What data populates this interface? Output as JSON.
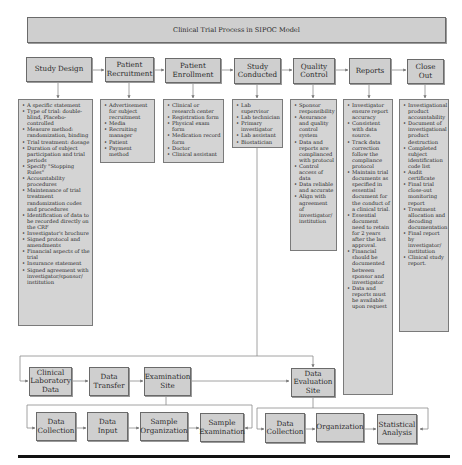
{
  "title": "Clinical Trial Process in SIPOC Model",
  "stages": [
    {
      "label": "Study Design",
      "items": [
        "A specific statement",
        "Type of trial: double-blind, Placebo-controlled",
        "Measure method: randomization, binding",
        "Trial treatment: dosage",
        "Duration of subject participation and trial periods",
        "Specify \"Stopping Rules\"",
        "Accountability procedures",
        "Maintenance of trial treatment randomization codes and procedures",
        "Identification of data to be recorded directly on the CRF",
        "Investigator's brochure",
        "Signed protocol and amendments",
        "Financial aspects of the trial",
        "Insurance statement",
        "Signed agreement with investigator/sponsor/ institution"
      ]
    },
    {
      "label": "Patient Recruitment",
      "items": [
        "Advertisement for subject recruitment",
        "Media",
        "Recruiting manager",
        "Patient",
        "Payment method"
      ]
    },
    {
      "label": "Patient Enrollment",
      "items": [
        "Clinical or research center",
        "Registration form",
        "Physical exam form",
        "Medication record form",
        "Doctor",
        "Clinical assistant"
      ]
    },
    {
      "label": "Study Conducted",
      "items": [
        "Lab supervisor",
        "Lab technician",
        "Primary investigator",
        "Lab assistant",
        "Biostatician"
      ]
    },
    {
      "label": "Quality Control",
      "items": [
        "Sponsor responsibility",
        "Assurance and quality control system",
        "Data and reports are complianced with protocol",
        "Control access of data",
        "Data reliable and accurate",
        "Align with agreement of investigator/ institution"
      ]
    },
    {
      "label": "Reports",
      "items": [
        "Investigator ensure report accuracy",
        "Consistent with data source.",
        "Track data correction follow the compliance protocol",
        "Maintain trial documents as specified in essential document for the conduct of a clinical trial.",
        "Essential document need to retain for 2 years after the last approval.",
        "Financial should be documented between sponsor and investigator",
        "Data and reports must be available upon request"
      ]
    },
    {
      "label": "Close Out",
      "items": [
        "Investigational product accountability",
        "Document of investigational product destruction",
        "Completed subject identification code list",
        "Audit certificate",
        "Final trial close-out monitoring report",
        "Treatment allocation and decoding documentation",
        "Final report by investigator/ institution",
        "Clinical study report."
      ]
    }
  ],
  "lower_row1": [
    "Clinical Laboratory Data",
    "Data Transfer",
    "Examination Site",
    "Data Evaluation Site"
  ],
  "lower_row2_left": [
    "Data Collection",
    "Data Input",
    "Sample Organization",
    "Sample Examination"
  ],
  "lower_row2_right": [
    "Data Collection",
    "Organization",
    "Statistical Analysis"
  ],
  "colors": {
    "box_fill": "#cfcfcf",
    "border": "#6a6a6a",
    "line": "#8a8a8a",
    "rule": "#111111"
  }
}
